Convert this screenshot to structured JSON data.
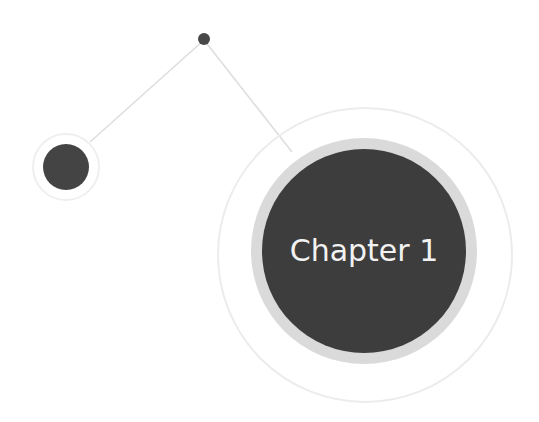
{
  "diagram": {
    "main_node": {
      "label": "Chapter 1"
    },
    "colors": {
      "node_fill": "#3d3d3d",
      "halo": "#d9d9d9",
      "thin_ring": "#ececec",
      "connector": "#dcdcdc",
      "label": "#f2f2f2"
    }
  }
}
